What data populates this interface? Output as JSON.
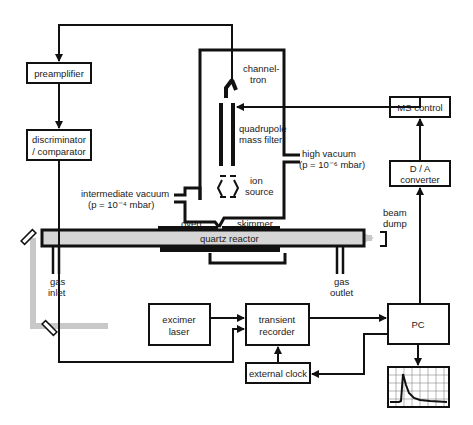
{
  "colors": {
    "line": "#111111",
    "beam": "#c8c8c8",
    "background": "#ffffff"
  },
  "blocks": {
    "preamplifier": "preamplifier",
    "discriminator": [
      "discriminator",
      "/ comparator"
    ],
    "ms_control": "MS control",
    "da_converter": [
      "D / A",
      "converter"
    ],
    "excimer_laser": [
      "excimer",
      "laser"
    ],
    "transient_recorder": [
      "transient",
      "recorder"
    ],
    "external_clock": "external clock",
    "pc": "PC"
  },
  "labels": {
    "channeltron": [
      "channel-",
      "tron"
    ],
    "quadrupole": [
      "quadrupole",
      "mass filter"
    ],
    "ion_source": [
      "ion",
      "source"
    ],
    "high_vacuum": [
      "high vacuum",
      "(p = 10⁻⁶ mbar)"
    ],
    "intermediate_vacuum": [
      "intermediate vacuum",
      "(p = 10⁻⁴ mbar)"
    ],
    "oven": "oven",
    "skimmer": "skimmer",
    "quartz_reactor": "quartz reactor",
    "beam_dump": [
      "beam",
      "dump"
    ],
    "gas_inlet": [
      "gas",
      "inlet"
    ],
    "gas_outlet": [
      "gas",
      "outlet"
    ]
  }
}
